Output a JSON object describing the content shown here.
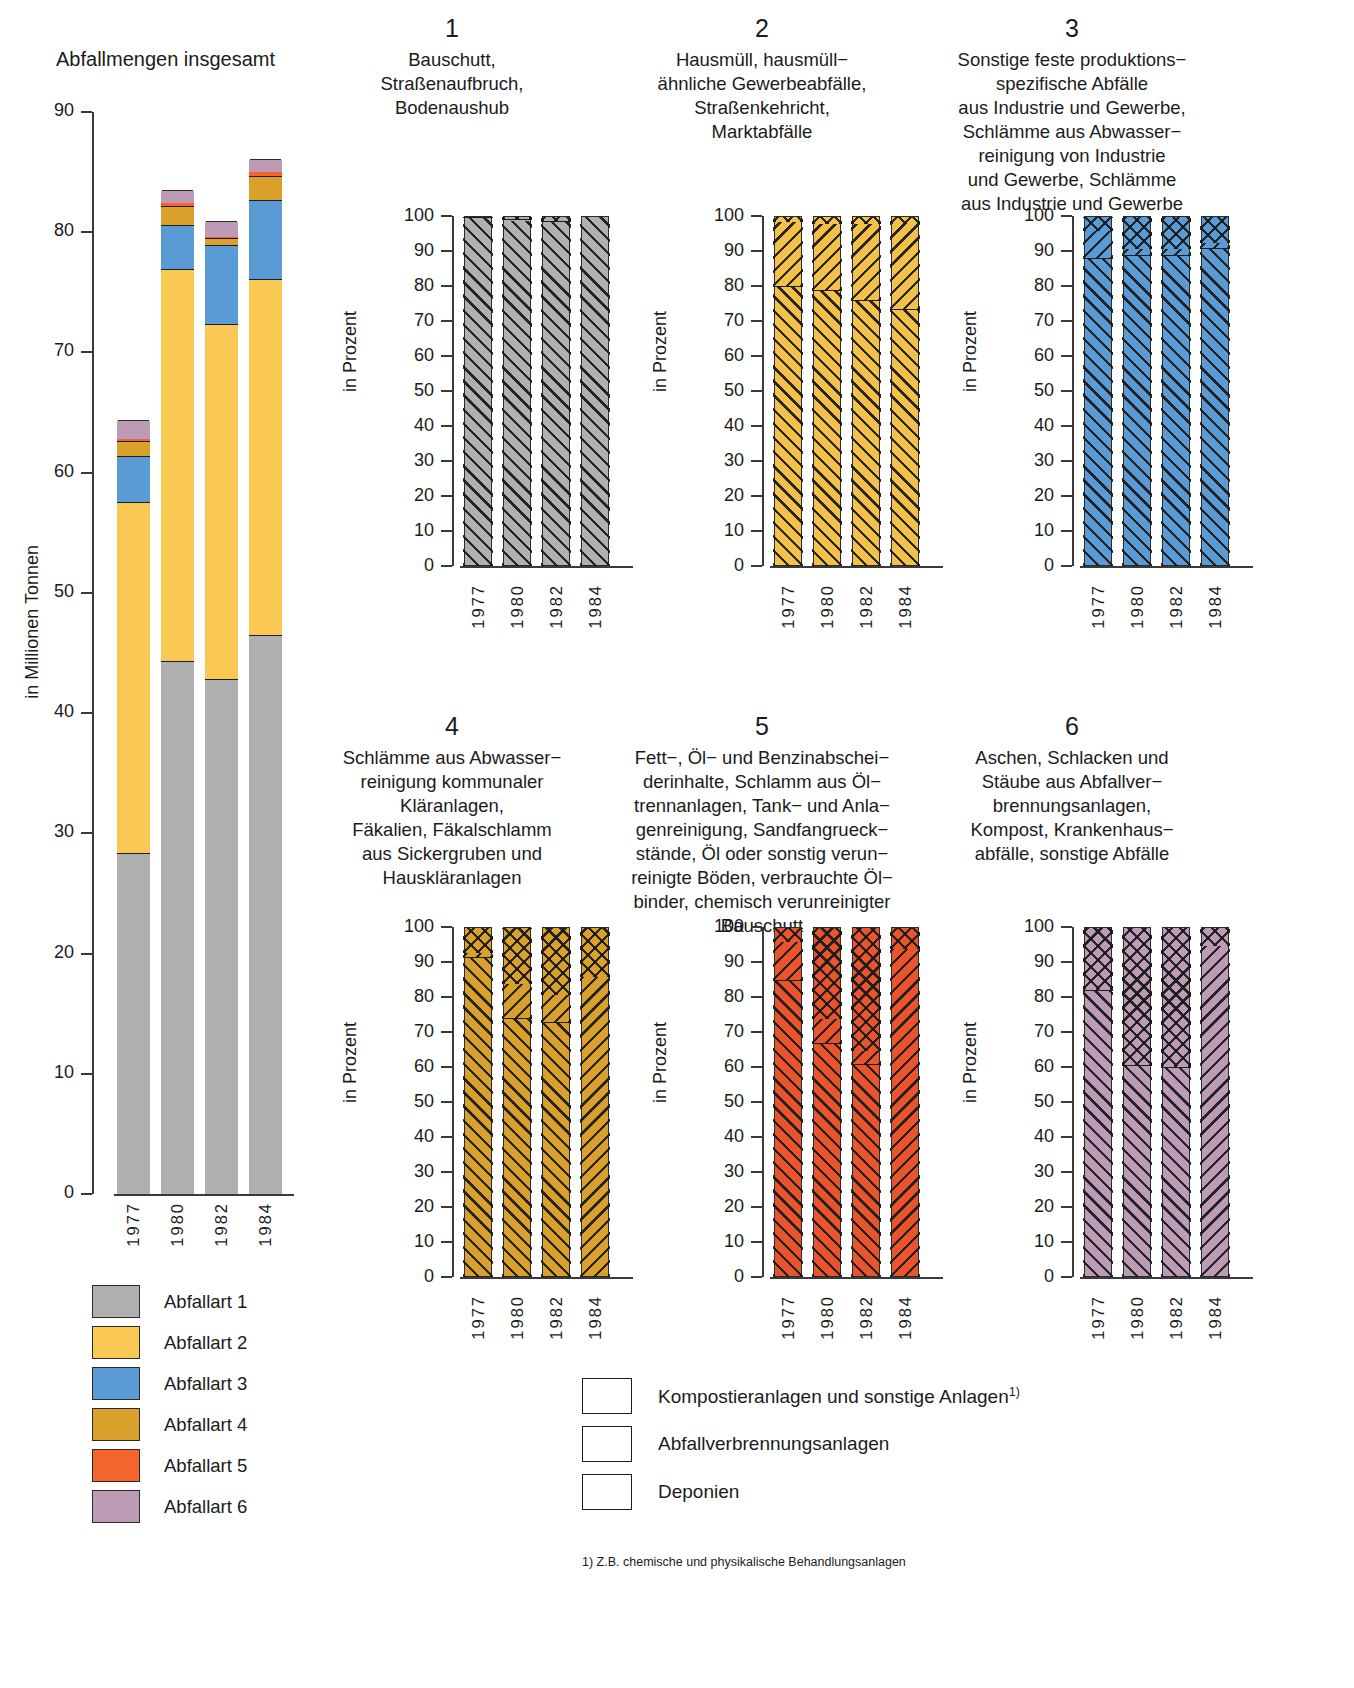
{
  "main_chart": {
    "title": "Abfallmengen insgesamt",
    "ylabel": "in Millionen Tonnen",
    "yticks": [
      "90",
      "80",
      "70",
      "60",
      "50",
      "40",
      "30",
      "20",
      "10",
      "0"
    ],
    "xticks": [
      "1977",
      "1980",
      "1982",
      "1984"
    ]
  },
  "panels": [
    {
      "number": "1",
      "title": "Bauschutt,\nStraßenaufbruch,\nBodenaushub",
      "color": "#b0b0b0",
      "ylabel": "in Prozent"
    },
    {
      "number": "2",
      "title": "Hausmüll, hausmüll−\nähnliche Gewerbeabfälle,\nStraßenkehricht,\nMarktabfälle",
      "color": "#f3c14a",
      "ylabel": "in Prozent"
    },
    {
      "number": "3",
      "title": "Sonstige feste produktions−\nspezifische Abfälle\naus Industrie und Gewerbe,\nSchlämme aus Abwasser−\nreinigung von Industrie\nund Gewerbe, Schlämme\naus Industrie und Gewerbe",
      "color": "#5b9bd5",
      "ylabel": "in Prozent"
    },
    {
      "number": "4",
      "title": "Schlämme aus Abwasser−\nreinigung kommunaler\nKläranlagen,\nFäkalien, Fäkalschlamm\naus Sickergruben und\nHauskläranlagen",
      "color": "#d9a12c",
      "ylabel": "in Prozent"
    },
    {
      "number": "5",
      "title": "Fett−, Öl− und Benzinabschei−\nderinhalte, Schlamm aus Öl−\ntrennanlagen, Tank− und Anla−\ngenreinigung, Sandfangrueck−\nstände, Öl oder sonstig verun−\nreinigte Böden, verbrauchte Öl−\nbinder, chemisch verunreinigter\nBauschutt",
      "color": "#e8552c",
      "ylabel": "in Prozent"
    },
    {
      "number": "6",
      "title": "Aschen, Schlacken und\nStäube aus Abfallver−\nbrennungsanlagen,\nKompost, Krankenhaus−\nabfälle, sonstige Abfälle",
      "color": "#bb9bb5",
      "ylabel": "in Prozent"
    }
  ],
  "color_legend": {
    "items": [
      {
        "label": "Abfallart 1",
        "color": "#b0b0b0"
      },
      {
        "label": "Abfallart 2",
        "color": "#f9c953"
      },
      {
        "label": "Abfallart 3",
        "color": "#5b9bd5"
      },
      {
        "label": "Abfallart 4",
        "color": "#d9a12c"
      },
      {
        "label": "Abfallart 5",
        "color": "#f4652e"
      },
      {
        "label": "Abfallart 6",
        "color": "#bb9bb5"
      }
    ]
  },
  "hatch_legend": {
    "items": [
      {
        "label": "Kompostieranlagen und sonstige Anlagen",
        "sup": "1)",
        "pattern": "cross"
      },
      {
        "label": "Abfallverbrennungsanlagen",
        "sup": "",
        "pattern": "forward"
      },
      {
        "label": "Deponien",
        "sup": "",
        "pattern": "backward"
      }
    ]
  },
  "footnote": "1) Z.B. chemische und physikalische Behandlungsanlagen",
  "chart_data": [
    {
      "type": "bar",
      "id": "abfallmengen-insgesamt",
      "title": "Abfallmengen insgesamt",
      "xlabel": "",
      "ylabel": "in Millionen Tonnen",
      "ylim": [
        0,
        90
      ],
      "yticks": [
        0,
        10,
        20,
        30,
        40,
        50,
        60,
        70,
        80,
        90
      ],
      "grid": false,
      "legend": "bottom-left",
      "categories": [
        "1977",
        "1980",
        "1982",
        "1984"
      ],
      "stacked": true,
      "series": [
        {
          "name": "Abfallart 1",
          "color": "#b0b0b0",
          "values": [
            28.4,
            44.3,
            42.8,
            46.5
          ]
        },
        {
          "name": "Abfallart 2",
          "color": "#f9c953",
          "values": [
            29.2,
            32.6,
            29.6,
            29.6
          ]
        },
        {
          "name": "Abfallart 3",
          "color": "#5b9bd5",
          "values": [
            3.8,
            3.7,
            6.5,
            6.6
          ]
        },
        {
          "name": "Abfallart 4",
          "color": "#d9a12c",
          "values": [
            1.2,
            1.6,
            0.6,
            2.0
          ]
        },
        {
          "name": "Abfallart 5",
          "color": "#f4652e",
          "values": [
            0.3,
            0.3,
            0.2,
            0.4
          ]
        },
        {
          "name": "Abfallart 6",
          "color": "#bb9bb5",
          "values": [
            1.5,
            1.0,
            1.2,
            1.0
          ]
        }
      ],
      "totals": [
        64.4,
        83.5,
        80.9,
        86.1
      ]
    },
    {
      "type": "bar",
      "id": "panel-1",
      "title": "Bauschutt, Straßenaufbruch, Bodenaushub",
      "ylabel": "in Prozent",
      "ylim": [
        0,
        100
      ],
      "yticks": [
        0,
        10,
        20,
        30,
        40,
        50,
        60,
        70,
        80,
        90,
        100
      ],
      "categories": [
        "1977",
        "1980",
        "1982",
        "1984"
      ],
      "stacked": true,
      "series": [
        {
          "name": "Deponien",
          "pattern": "backward",
          "values": [
            99.8,
            99.0,
            98.5,
            100.0
          ]
        },
        {
          "name": "Abfallverbrennungsanlagen",
          "pattern": "forward",
          "values": [
            0.2,
            0.3,
            0.3,
            0.0
          ]
        },
        {
          "name": "Kompostieranlagen und sonstige Anlagen",
          "pattern": "cross",
          "values": [
            0.0,
            0.7,
            1.2,
            0.0
          ]
        }
      ]
    },
    {
      "type": "bar",
      "id": "panel-2",
      "title": "Hausmüll, hausmüllähnliche Gewerbeabfälle, Straßenkehricht, Marktabfälle",
      "ylabel": "in Prozent",
      "ylim": [
        0,
        100
      ],
      "yticks": [
        0,
        10,
        20,
        30,
        40,
        50,
        60,
        70,
        80,
        90,
        100
      ],
      "categories": [
        "1977",
        "1980",
        "1982",
        "1984"
      ],
      "stacked": true,
      "series": [
        {
          "name": "Deponien",
          "pattern": "backward",
          "values": [
            80.0,
            79.0,
            76.0,
            73.5
          ]
        },
        {
          "name": "Abfallverbrennungsanlagen",
          "pattern": "forward",
          "values": [
            18.5,
            19.0,
            22.0,
            24.5
          ]
        },
        {
          "name": "Kompostieranlagen und sonstige Anlagen",
          "pattern": "cross",
          "values": [
            1.5,
            2.0,
            2.0,
            2.0
          ]
        }
      ]
    },
    {
      "type": "bar",
      "id": "panel-3",
      "title": "Sonstige feste produktionsspezifische Abfälle aus Industrie und Gewerbe, Schlämme aus Abwasserreinigung von Industrie und Gewerbe, Schlämme aus Industrie und Gewerbe",
      "ylabel": "in Prozent",
      "ylim": [
        0,
        100
      ],
      "yticks": [
        0,
        10,
        20,
        30,
        40,
        50,
        60,
        70,
        80,
        90,
        100
      ],
      "categories": [
        "1977",
        "1980",
        "1982",
        "1984"
      ],
      "stacked": true,
      "series": [
        {
          "name": "Deponien",
          "pattern": "backward",
          "values": [
            88.0,
            89.0,
            89.0,
            91.0
          ]
        },
        {
          "name": "Abfallverbrennungsanlagen",
          "pattern": "forward",
          "values": [
            8.0,
            2.0,
            2.0,
            1.5
          ]
        },
        {
          "name": "Kompostieranlagen und sonstige Anlagen",
          "pattern": "cross",
          "values": [
            4.0,
            9.0,
            9.0,
            7.5
          ]
        }
      ]
    },
    {
      "type": "bar",
      "id": "panel-4",
      "title": "Schlämme aus Abwasserreinigung kommunaler Kläranlagen, Fäkalien, Fäkalschlamm aus Sickergruben und Hauskläranlagen",
      "ylabel": "in Prozent",
      "ylim": [
        0,
        100
      ],
      "yticks": [
        0,
        10,
        20,
        30,
        40,
        50,
        60,
        70,
        80,
        90,
        100
      ],
      "categories": [
        "1977",
        "1980",
        "1982",
        "1984"
      ],
      "stacked": true,
      "series": [
        {
          "name": "Deponien",
          "pattern": "backward",
          "values": [
            91.5,
            74.0,
            73.0,
            0.0
          ]
        },
        {
          "name": "Abfallverbrennungsanlagen",
          "pattern": "forward",
          "values": [
            1.5,
            10.0,
            8.0,
            86.0
          ]
        },
        {
          "name": "Kompostieranlagen und sonstige Anlagen",
          "pattern": "cross",
          "values": [
            7.0,
            16.0,
            19.0,
            14.0
          ]
        }
      ]
    },
    {
      "type": "bar",
      "id": "panel-5",
      "title": "Fett-, Öl- und Benzinabscheiderinhalte, Schlamm aus Öltrennanlagen, Tank- und Anlagenreinigung, Sandfangrueckstände, Öl oder sonstig verunreinigte Böden, verbrauchte Ölbinder, chemisch verunreinigter Bauschutt",
      "ylabel": "in Prozent",
      "ylim": [
        0,
        100
      ],
      "yticks": [
        0,
        10,
        20,
        30,
        40,
        50,
        60,
        70,
        80,
        90,
        100
      ],
      "categories": [
        "1977",
        "1980",
        "1982",
        "1984"
      ],
      "stacked": true,
      "series": [
        {
          "name": "Deponien",
          "pattern": "backward",
          "values": [
            85.0,
            67.0,
            61.0,
            0.0
          ]
        },
        {
          "name": "Abfallverbrennungsanlagen",
          "pattern": "forward",
          "values": [
            11.0,
            7.0,
            4.0,
            94.0
          ]
        },
        {
          "name": "Kompostieranlagen und sonstige Anlagen",
          "pattern": "cross",
          "values": [
            4.0,
            26.0,
            35.0,
            6.0
          ]
        }
      ]
    },
    {
      "type": "bar",
      "id": "panel-6",
      "title": "Aschen, Schlacken und Stäube aus Abfallverbrennungsanlagen, Kompost, Krankenhausabfälle, sonstige Abfälle",
      "ylabel": "in Prozent",
      "ylim": [
        0,
        100
      ],
      "yticks": [
        0,
        10,
        20,
        30,
        40,
        50,
        60,
        70,
        80,
        90,
        100
      ],
      "categories": [
        "1977",
        "1980",
        "1982",
        "1984"
      ],
      "stacked": true,
      "series": [
        {
          "name": "Deponien",
          "pattern": "backward",
          "values": [
            82.0,
            60.5,
            60.0,
            0.0
          ]
        },
        {
          "name": "Abfallverbrennungsanlagen",
          "pattern": "forward",
          "values": [
            0.5,
            0.5,
            0.5,
            95.0
          ]
        },
        {
          "name": "Kompostieranlagen und sonstige Anlagen",
          "pattern": "cross",
          "values": [
            17.5,
            39.0,
            39.5,
            5.0
          ]
        }
      ]
    }
  ]
}
